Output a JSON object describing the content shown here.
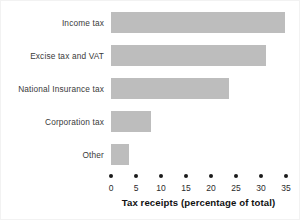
{
  "chart_data": {
    "type": "bar",
    "orientation": "horizontal",
    "title": "",
    "xlabel": "Tax receipts (percentage of total)",
    "ylabel": "",
    "categories": [
      "Income tax",
      "Excise tax and VAT",
      "National Insurance tax",
      "Corporation tax",
      "Other"
    ],
    "values": [
      34.8,
      31.0,
      23.6,
      8.0,
      3.5
    ],
    "xlim": [
      0,
      35
    ],
    "xticks": [
      0,
      5,
      10,
      15,
      20,
      25,
      30,
      35
    ],
    "xtick_labels": [
      "0",
      "5",
      "10",
      "15",
      "20",
      "25",
      "30",
      "35"
    ],
    "grid": false,
    "legend": null,
    "bar_color": "#bdbdbd",
    "tick_color": "#1a1a1a",
    "text_color": "#2b2b2b",
    "background": "#ffffff"
  }
}
